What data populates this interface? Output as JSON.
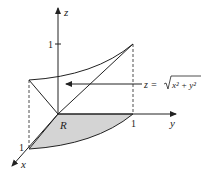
{
  "diagram": {
    "axes": {
      "x_label": "x",
      "y_label": "y",
      "z_label": "z",
      "x_tick": "1",
      "y_tick": "1",
      "z_tick": "1"
    },
    "region_label": "R",
    "surface_label": "z = √(x² + y²)",
    "surface_label_parts": {
      "lhs": "z =",
      "radicand": "x² + y²"
    },
    "colors": {
      "region_fill": "#d4d4d4",
      "line": "#222222"
    }
  }
}
